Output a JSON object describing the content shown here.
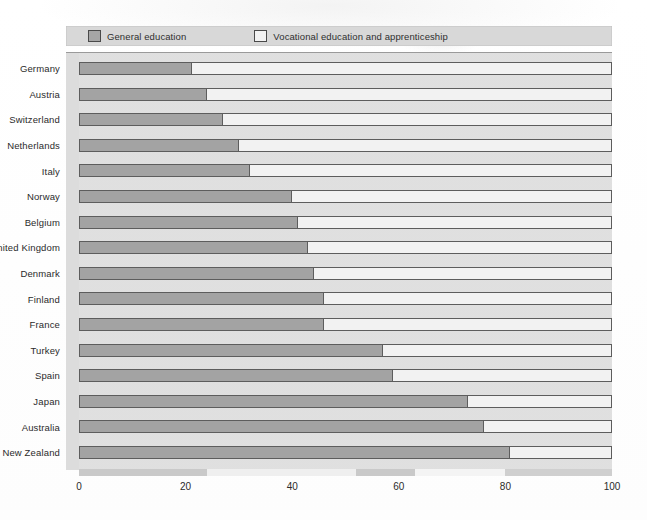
{
  "legend": {
    "items": [
      {
        "label": "General education",
        "color": "#a3a3a3",
        "icon": "legend-swatch-filled"
      },
      {
        "label": "Vocational education and apprenticeship",
        "color": "#f2f2f2",
        "icon": "legend-swatch-empty"
      }
    ]
  },
  "axis": {
    "ticks": [
      "0",
      "20",
      "40",
      "60",
      "80",
      "100"
    ],
    "min": 0,
    "max": 100
  },
  "chart_data": {
    "type": "bar",
    "orientation": "horizontal",
    "stacked": true,
    "normalized_percent": true,
    "title": "",
    "subtitle": "",
    "xlabel": "",
    "ylabel": "",
    "xlim": [
      0,
      100
    ],
    "grid": false,
    "legend_position": "top",
    "categories": [
      "Germany",
      "Austria",
      "Switzerland",
      "Netherlands",
      "Italy",
      "Norway",
      "Belgium",
      "United Kingdom",
      "Denmark",
      "Finland",
      "France",
      "Turkey",
      "Spain",
      "Japan",
      "Australia",
      "New Zealand"
    ],
    "series": [
      {
        "name": "General education",
        "color": "#a3a3a3",
        "values": [
          21,
          24,
          27,
          30,
          32,
          40,
          41,
          43,
          44,
          46,
          46,
          57,
          59,
          73,
          76,
          81
        ]
      },
      {
        "name": "Vocational education and apprenticeship",
        "color": "#f2f2f2",
        "values": [
          79,
          76,
          73,
          70,
          68,
          60,
          59,
          57,
          56,
          54,
          54,
          43,
          41,
          27,
          24,
          19
        ]
      }
    ]
  }
}
